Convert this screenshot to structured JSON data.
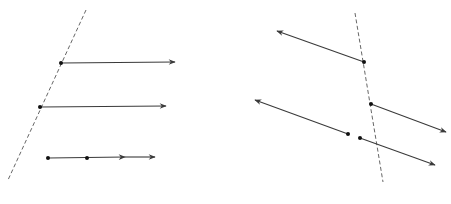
{
  "diagram": {
    "colors": {
      "stroke": "#3a3a3a",
      "dashed": "#555555",
      "background": "#ffffff"
    },
    "left_panel": {
      "dashed_line": {
        "x1": 86,
        "y1": 10,
        "x2": 8,
        "y2": 180
      },
      "rays": [
        {
          "x1": 61,
          "y1": 63,
          "x2": 175,
          "y2": 62,
          "endpoint": true
        },
        {
          "x1": 40,
          "y1": 107,
          "x2": 166,
          "y2": 106,
          "endpoint": true
        }
      ],
      "double_arrow_ray": {
        "x1": 48,
        "y1": 158,
        "x2": 155,
        "y2": 157,
        "points": [
          [
            48,
            158
          ],
          [
            87,
            158
          ]
        ],
        "mid_arrow": [
          125,
          157
        ]
      }
    },
    "right_panel": {
      "dashed_line": {
        "x1": 355,
        "y1": 13,
        "x2": 383,
        "y2": 182
      },
      "rays": [
        {
          "x1": 364,
          "y1": 62,
          "x2": 277,
          "y2": 31
        },
        {
          "x1": 371,
          "y1": 104,
          "x2": 446,
          "y2": 132
        },
        {
          "x1": 348,
          "y1": 134,
          "x2": 255,
          "y2": 100
        },
        {
          "x1": 360,
          "y1": 138,
          "x2": 435,
          "y2": 165
        }
      ]
    }
  }
}
